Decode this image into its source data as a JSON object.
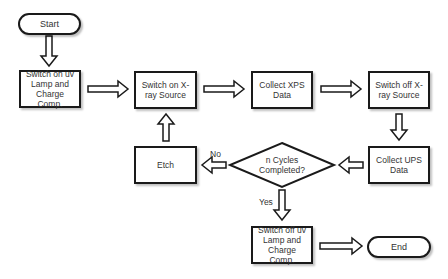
{
  "diagram": {
    "type": "flowchart",
    "nodes": {
      "start": {
        "label": "Start",
        "shape": "terminal"
      },
      "uv_on": {
        "label": "Switch on uv Lamp and Charge Comp.",
        "shape": "process"
      },
      "xray_on": {
        "label": "Switch on X-ray Source",
        "shape": "process"
      },
      "collect_xps": {
        "label": "Collect XPS Data",
        "shape": "process"
      },
      "xray_off": {
        "label": "Switch off X-ray Source",
        "shape": "process"
      },
      "collect_ups": {
        "label": "Collect UPS Data",
        "shape": "process"
      },
      "decision": {
        "label": "n Cycles Completed?",
        "shape": "decision"
      },
      "etch": {
        "label": "Etch",
        "shape": "process"
      },
      "uv_off": {
        "label": "Switch off uv Lamp and Charge Comp.",
        "shape": "process"
      },
      "end": {
        "label": "End",
        "shape": "terminal"
      }
    },
    "edges": [
      {
        "from": "start",
        "to": "uv_on",
        "label": ""
      },
      {
        "from": "uv_on",
        "to": "xray_on",
        "label": ""
      },
      {
        "from": "xray_on",
        "to": "collect_xps",
        "label": ""
      },
      {
        "from": "collect_xps",
        "to": "xray_off",
        "label": ""
      },
      {
        "from": "xray_off",
        "to": "collect_ups",
        "label": ""
      },
      {
        "from": "collect_ups",
        "to": "decision",
        "label": ""
      },
      {
        "from": "decision",
        "to": "etch",
        "label": "No"
      },
      {
        "from": "etch",
        "to": "xray_on",
        "label": ""
      },
      {
        "from": "decision",
        "to": "uv_off",
        "label": "Yes"
      },
      {
        "from": "uv_off",
        "to": "end",
        "label": ""
      }
    ],
    "edge_labels": {
      "no": "No",
      "yes": "Yes"
    }
  }
}
